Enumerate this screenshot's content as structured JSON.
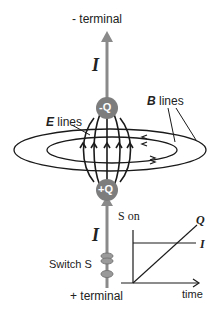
{
  "diagram": {
    "labels": {
      "neg_terminal": "- terminal",
      "pos_terminal": "+ terminal",
      "current_top": "I",
      "current_bottom": "I",
      "neg_charge": "-Q",
      "pos_charge": "+Q",
      "e_lines_sym": "E",
      "e_lines_word": " lines",
      "b_lines_sym": "B",
      "b_lines_word": " lines",
      "switch": "Switch S"
    },
    "graph": {
      "title": "S on",
      "x_label": "time",
      "series_q": "Q",
      "series_i": "I"
    },
    "colors": {
      "wire": "#8a8a8a",
      "plate": "#7d7d7d",
      "plate_text": "#ffffff",
      "lines": "#1a1a1a"
    }
  }
}
